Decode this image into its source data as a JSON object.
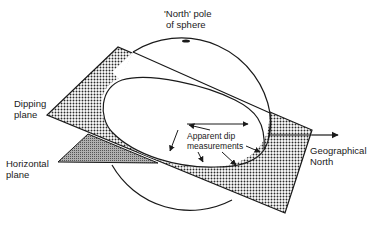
{
  "figure": {
    "type": "diagram",
    "colors": {
      "line": "#1a1a1a",
      "background": "#ffffff",
      "dot_pattern": "#2a2a2a",
      "horizontal_fill": "#8a8a8a"
    }
  },
  "labels": {
    "north_pole": {
      "line1": "'North' pole",
      "line2": "of sphere"
    },
    "dipping_plane": {
      "line1": "Dipping",
      "line2": "plane"
    },
    "horizontal_plane": {
      "line1": "Horizontal",
      "line2": "plane"
    },
    "apparent_dip": {
      "line1": "Apparent dip",
      "line2": "measurements"
    },
    "geographical_north": {
      "line1": "Geographical",
      "line2": "North"
    }
  }
}
